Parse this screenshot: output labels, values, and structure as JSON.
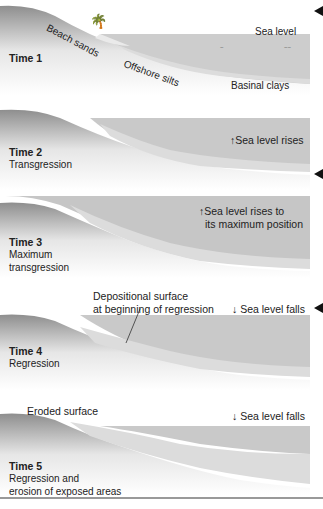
{
  "colors": {
    "sea": "#c9c9c9",
    "land_light": "#f2f2f2",
    "land_dark": "#9a9a9a",
    "sediment": "#dcdcdc",
    "text": "#222222",
    "marker": "#111111"
  },
  "panels": [
    {
      "time": "Time 1",
      "subtitle": "",
      "labels": {
        "sea_level": "Sea level",
        "beach": "Beach sands",
        "offshore": "Offshore silts",
        "basinal": "Basinal clays"
      },
      "icons": [
        "palm-tree-icon",
        "bird-icon"
      ]
    },
    {
      "time": "Time 2",
      "subtitle": "Transgression",
      "sea_note": "Sea level rises",
      "arrow": "up"
    },
    {
      "time": "Time 3",
      "subtitle_lines": [
        "Maximum",
        "transgression"
      ],
      "sea_note_lines": [
        "Sea level rises to",
        "its maximum position"
      ],
      "arrow": "up"
    },
    {
      "time": "Time 4",
      "subtitle": "Regression",
      "sea_note": "Sea level falls",
      "arrow": "down",
      "callout_lines": [
        "Depositional surface",
        "at beginning of regression"
      ]
    },
    {
      "time": "Time 5",
      "subtitle_lines": [
        "Regression and",
        "erosion of exposed areas"
      ],
      "sea_note": "Sea level falls",
      "arrow": "down",
      "callout": "Eroded surface"
    }
  ],
  "arrows": {
    "up": "↑",
    "down": "↓"
  }
}
